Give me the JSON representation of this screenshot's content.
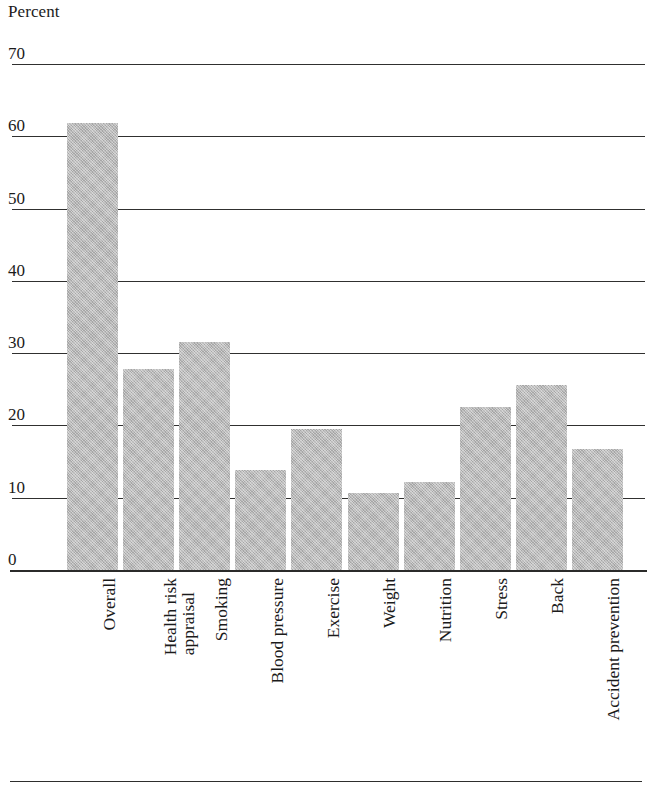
{
  "chart_data": {
    "type": "bar",
    "title": "",
    "ylabel": "Percent",
    "xlabel": "",
    "ylim": [
      0,
      70
    ],
    "yticks": [
      0,
      10,
      20,
      30,
      40,
      50,
      60,
      70
    ],
    "ytick_labels": [
      "0",
      "10",
      "20",
      "30",
      "40",
      "50",
      "60",
      "70"
    ],
    "grid": true,
    "legend": "none",
    "bar_color": "#b6b6b6",
    "axis_color": "#2e2e2d",
    "categories": [
      "Overall",
      "Health risk appraisal",
      "Smoking",
      "Blood pressure",
      "Exercise",
      "Weight",
      "Nutrition",
      "Stress",
      "Back",
      "Accident prevention"
    ],
    "category_lines": [
      [
        "Overall"
      ],
      [
        "Health risk",
        "appraisal"
      ],
      [
        "Smoking"
      ],
      [
        "Blood pressure"
      ],
      [
        "Exercise"
      ],
      [
        "Weight"
      ],
      [
        "Nutrition"
      ],
      [
        "Stress"
      ],
      [
        "Back"
      ],
      [
        "Accident prevention"
      ]
    ],
    "values": [
      61.8,
      27.8,
      31.5,
      13.8,
      19.5,
      10.7,
      12.2,
      22.6,
      25.6,
      16.8
    ]
  }
}
